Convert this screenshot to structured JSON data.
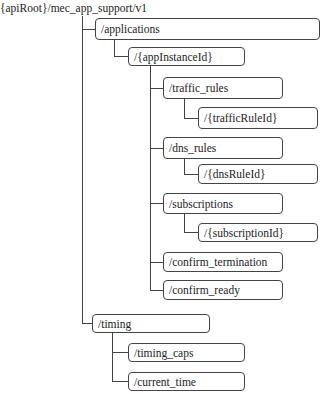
{
  "diagram": {
    "root": "{apiRoot}/mec_app_support/v1",
    "nodes": {
      "applications": "/applications",
      "app_instance_id": "/{appInstanceId}",
      "traffic_rules": "/traffic_rules",
      "traffic_rule_id": "/{trafficRuleId}",
      "dns_rules": "/dns_rules",
      "dns_rule_id": "/{dnsRuleId}",
      "subscriptions": "/subscriptions",
      "subscription_id": "/{subscriptionId}",
      "confirm_termination": "/confirm_termination",
      "confirm_ready": "/confirm_ready",
      "timing": "/timing",
      "timing_caps": "/timing_caps",
      "current_time": "/current_time"
    },
    "tree": {
      "name": "{apiRoot}/mec_app_support/v1",
      "children": [
        {
          "name": "/applications",
          "children": [
            {
              "name": "/{appInstanceId}",
              "children": [
                {
                  "name": "/traffic_rules",
                  "children": [
                    {
                      "name": "/{trafficRuleId}"
                    }
                  ]
                },
                {
                  "name": "/dns_rules",
                  "children": [
                    {
                      "name": "/{dnsRuleId}"
                    }
                  ]
                },
                {
                  "name": "/subscriptions",
                  "children": [
                    {
                      "name": "/{subscriptionId}"
                    }
                  ]
                },
                {
                  "name": "/confirm_termination"
                },
                {
                  "name": "/confirm_ready"
                }
              ]
            }
          ]
        },
        {
          "name": "/timing",
          "children": [
            {
              "name": "/timing_caps"
            },
            {
              "name": "/current_time"
            }
          ]
        }
      ]
    }
  }
}
